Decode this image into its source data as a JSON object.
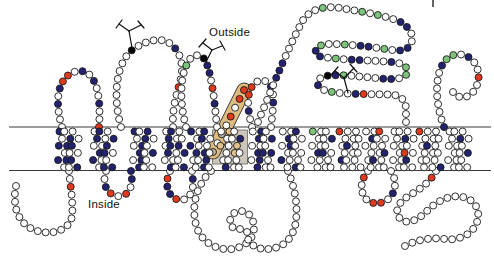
{
  "figure": {
    "outside_label": "Outside",
    "inside_label": "Inside",
    "membrane": {
      "top_y": 127,
      "bottom_y": 170.5,
      "x1": 9,
      "x2": 491
    },
    "residue_radius": 3.5,
    "spacing": 8,
    "palette": {
      "outline": "#1a1a1a",
      "w": "#ffffff",
      "n": "#22226e",
      "r": "#e03a1e",
      "g": "#7cc47c",
      "k": "#000000",
      "t": "#e3c18c",
      "y": "#b9b2a6",
      "line": "#3a3a3a",
      "boxfill": "#cdc6ba",
      "capsule_fill": "#debb7e",
      "capsule_edge": "#333333"
    },
    "chains": [
      {
        "name": "outside-loop-1",
        "path": "M 62 127 C 54 100, 58 78, 74 72 C 92 66, 102 86, 99 127",
        "colors": {
          "3": "n",
          "5": "n",
          "6": "r",
          "7": "r",
          "9": "n",
          "11": "n",
          "14": "n",
          "17": "r"
        }
      },
      {
        "name": "outside-loop-glycan-1",
        "path": "M 121 127 C 112 95, 117 62, 132 50 C 146 40, 162 36, 172 45 C 182 54, 184 68, 180 82 C 176 96, 172 110, 173 127",
        "colors": {
          "10": "k",
          "16": "n",
          "21": "r"
        }
      },
      {
        "name": "outside-loop-glycan-2",
        "path": "M 186 127 C 180 105, 179 78, 188 62 C 193 53, 202 53, 206 62 C 210 71, 212 85, 214 98 C 215 108, 216 118, 217 127",
        "colors": {
          "8": "g",
          "11": "k",
          "12": "n",
          "13": "n",
          "15": "r",
          "17": "n"
        }
      },
      {
        "name": "outside-loop-2",
        "path": "M 252 127 C 247 108, 246 92, 254 84 C 262 76, 272 82, 273 94 C 274 105, 272 116, 271 127",
        "colors": {
          "2": "n",
          "4": "r",
          "5": "r",
          "8": "n",
          "10": "n"
        }
      },
      {
        "name": "outside-large-domain",
        "path": "M 258 122 C 272 88, 288 48, 302 22 C 308 10, 324 5, 340 8 C 358 11, 378 14, 396 20 C 406 24, 413 31, 412 40 C 411 48, 404 52, 392 50 C 372 47, 350 44, 330 44 C 318 44, 312 50, 318 56 C 336 60, 368 60, 392 62 C 404 63, 410 68, 406 75 C 400 81, 384 79, 366 77 C 352 76, 336 74, 326 76 C 316 78, 314 86, 324 90 C 344 96, 372 93, 394 95 C 402 96, 406 102, 406 110 C 406 116, 406 120, 406 122",
        "colors": {
          "6": "n",
          "7": "n",
          "8": "n",
          "17": "g",
          "22": "g",
          "24": "g",
          "27": "n",
          "28": "n",
          "31": "n",
          "32": "n",
          "34": "g",
          "36": "n",
          "37": "n",
          "39": "g",
          "42": "g",
          "43": "n",
          "44": "n",
          "46": "g",
          "48": "n",
          "49": "n",
          "53": "n",
          "55": "g",
          "56": "g",
          "58": "n",
          "59": "n",
          "64": "g",
          "65": "n",
          "66": "k",
          "68": "n",
          "70": "g",
          "73": "n",
          "74": "r"
        }
      },
      {
        "name": "outside-loop-3",
        "path": "M 444 127 C 436 106, 433 76, 445 61 C 453 51, 467 53, 474 62 C 481 71, 480 86, 471 94 C 465 99, 457 98, 453 92",
        "colors": {
          "0": "n",
          "8": "n",
          "9": "g",
          "10": "g",
          "12": "n",
          "15": "r"
        }
      },
      {
        "name": "n-terminus",
        "path": "M 16 186 C 12 206, 18 222, 32 229 C 48 236, 64 232, 70 222 C 75 214, 71 192, 69 171",
        "colors": {
          "16": "r"
        }
      },
      {
        "name": "inside-loop-1",
        "path": "M 106 171 C 102 183, 106 194, 117 196 C 128 197, 134 188, 131 171",
        "colors": {
          "2": "n",
          "3": "r",
          "5": "r",
          "7": "n",
          "8": "n"
        }
      },
      {
        "name": "inside-loop-2",
        "path": "M 170 171 C 165 182, 166 194, 176 199 C 186 203, 194 194, 193 182 C 193 178, 192 174, 192 171",
        "colors": {
          "1": "r",
          "2": "n",
          "3": "n",
          "4": "r",
          "8": "n"
        }
      },
      {
        "name": "inside-large-loop-left",
        "path": "M 211 171 C 197 184, 190 207, 197 228 C 204 247, 226 254, 242 246 C 254 240, 257 227, 251 217 C 246 209, 235 209, 231 217 C 228 224, 233 231, 240 229",
        "colors": {}
      },
      {
        "name": "inside-large-loop-right",
        "path": "M 288 171 C 294 186, 298 203, 296 220 C 294 240, 281 250, 264 249 C 253 248, 246 241, 247 232",
        "colors": {}
      },
      {
        "name": "inside-loop-3",
        "path": "M 368 171 C 361 179, 359 191, 366 199 C 373 206, 386 204, 392 195 C 397 187, 395 177, 391 171",
        "colors": {
          "1": "r",
          "5": "r",
          "6": "r",
          "8": "n"
        }
      },
      {
        "name": "c-terminus",
        "path": "M 436 171 C 429 184, 418 190, 407 197 C 396 204, 394 215, 402 220 C 410 225, 420 218, 428 210 C 437 201, 451 194, 463 197 C 475 200, 481 210, 477 222 C 473 234, 459 241, 445 239 C 431 237, 416 240, 405 246",
        "colors": {
          "1": "r"
        }
      }
    ],
    "tm_clusters": [
      {
        "cx": 68,
        "pattern": "nwnwnwwnnwnwwwnwnn"
      },
      {
        "cx": 103,
        "pattern": "wnwnnwnwwnwnwnnwwn"
      },
      {
        "cx": 143,
        "pattern": "nwwnwnwnnwnwnwwnww"
      },
      {
        "cx": 174,
        "pattern": "wnwnwnnwnwwwwwnnwn"
      },
      {
        "cx": 201,
        "pattern": "nwnnwwwnwnwnnwwwnw"
      },
      {
        "cx": 231,
        "pattern": "wwtwwntwwtwwwntwww"
      },
      {
        "cx": 262,
        "pattern": "wnwnwnnwwnnwwnwnww"
      },
      {
        "cx": 292,
        "pattern": "wnwwnwwwnwwnnwwwww"
      },
      {
        "cx": 322,
        "pattern": "gwwnwwwwwnwwwnwwww"
      },
      {
        "cx": 350,
        "pattern": "rwwwnwwwnwwwwwwwww"
      },
      {
        "cx": 376,
        "pattern": "wnwwwwwwwwnwrwwnww"
      },
      {
        "cx": 403,
        "pattern": "wwwwwwwnwrwwwwwwnw"
      },
      {
        "cx": 430,
        "pattern": "rwwwwwwwnwwwwwwwwn"
      },
      {
        "cx": 458,
        "pattern": "wwwwwwwnwwwwwwwnww"
      }
    ],
    "shaded_box": {
      "x": 212.5,
      "y": 130,
      "w": 35,
      "h": 34
    },
    "capsule": {
      "x1": 213,
      "y1": 152,
      "x2": 244,
      "y2": 90,
      "width": 15,
      "residues": [
        "y",
        "w",
        "y",
        "w",
        "r",
        "w",
        "r",
        "r"
      ]
    },
    "glycans": [
      {
        "name": "glycan-1",
        "lines": [
          [
            132,
            48,
            129,
            31
          ],
          [
            129,
            31,
            119,
            24
          ],
          [
            129,
            31,
            141,
            25
          ],
          [
            116,
            28,
            122,
            20
          ],
          [
            138,
            21,
            144,
            28
          ]
        ]
      },
      {
        "name": "glycan-2",
        "lines": [
          [
            206,
            62,
            212,
            50
          ],
          [
            212,
            50,
            203,
            43
          ],
          [
            212,
            50,
            222,
            46
          ],
          [
            199,
            47,
            206,
            39
          ],
          [
            220,
            41,
            225,
            50
          ]
        ]
      },
      {
        "name": "glycan-3",
        "lines": [
          [
            348,
            93,
            344,
            78
          ],
          [
            344,
            78,
            335,
            71
          ],
          [
            344,
            78,
            354,
            68
          ],
          [
            331,
            75,
            338,
            67
          ],
          [
            350,
            64,
            357,
            72
          ]
        ]
      }
    ],
    "corner_mark": {
      "lines": [
        [
          433,
          0,
          433,
          7
        ]
      ]
    }
  }
}
